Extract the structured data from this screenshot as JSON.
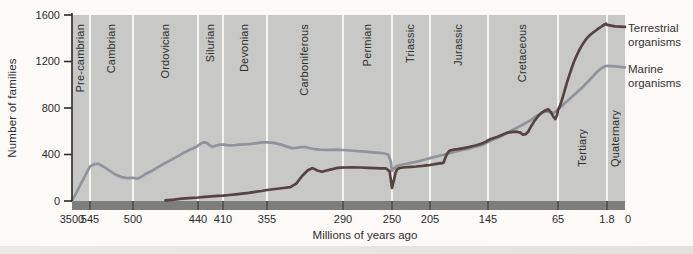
{
  "colors": {
    "plot_bg": "#c8c8c6",
    "gridline": "#f3f3f0",
    "axis_band": "#7e7e7c",
    "axis_band_tick": "#4f4f4d",
    "axis_line": "#2a2a2a",
    "terrestrial": "#544341",
    "marine": "#8f939b",
    "text": "#2e2e2e"
  },
  "figure": {
    "periods": [
      {
        "name": "Pre-cambrian",
        "from": 3500,
        "to": 545,
        "label_valign": "top"
      },
      {
        "name": "Cambrian",
        "from": 545,
        "to": 500,
        "label_valign": "top"
      },
      {
        "name": "Ordovician",
        "from": 500,
        "to": 440,
        "label_valign": "top"
      },
      {
        "name": "Silurian",
        "from": 440,
        "to": 410,
        "label_valign": "top"
      },
      {
        "name": "Devonian",
        "from": 410,
        "to": 355,
        "label_valign": "top"
      },
      {
        "name": "Carboniferous",
        "from": 355,
        "to": 290,
        "label_valign": "top"
      },
      {
        "name": "Permian",
        "from": 290,
        "to": 250,
        "label_valign": "top"
      },
      {
        "name": "Triassic",
        "from": 250,
        "to": 205,
        "label_valign": "top"
      },
      {
        "name": "Jurassic",
        "from": 205,
        "to": 145,
        "label_valign": "top"
      },
      {
        "name": "Cretaceous",
        "from": 145,
        "to": 65,
        "label_valign": "top"
      },
      {
        "name": "Tertiary",
        "from": 65,
        "to": 1.8,
        "label_valign": "bottom"
      },
      {
        "name": "Quaternary",
        "from": 1.8,
        "to": 0,
        "label_valign": "bottom"
      }
    ]
  },
  "chart_data": {
    "type": "line",
    "title": "",
    "xlabel": "Millions of years ago",
    "ylabel": "Number of families",
    "ylim": [
      0,
      1600
    ],
    "y_ticks": [
      0,
      400,
      800,
      1200,
      1600
    ],
    "x_direction": "reversed (3500 Ma at left, 0 at right)",
    "grid": "white vertical lines at geologic period boundaries",
    "legend_position": "right, outside plot",
    "x_ticks": [
      {
        "label": "3500",
        "ma": 3500
      },
      {
        "label": "545",
        "ma": 545
      },
      {
        "label": "500",
        "ma": 500
      },
      {
        "label": "440",
        "ma": 440
      },
      {
        "label": "410",
        "ma": 410
      },
      {
        "label": "355",
        "ma": 355
      },
      {
        "label": "290",
        "ma": 290
      },
      {
        "label": "250",
        "ma": 250
      },
      {
        "label": "205",
        "ma": 205
      },
      {
        "label": "145",
        "ma": 145
      },
      {
        "label": "65",
        "ma": 65
      },
      {
        "label": "1.8",
        "ma": 1.8
      },
      {
        "label": "0",
        "ma": 0
      }
    ],
    "x_axis_px": [
      [
        3500,
        72
      ],
      [
        545,
        90
      ],
      [
        500,
        133
      ],
      [
        440,
        198
      ],
      [
        410,
        223
      ],
      [
        355,
        267
      ],
      [
        290,
        343
      ],
      [
        250,
        392
      ],
      [
        205,
        430
      ],
      [
        145,
        488
      ],
      [
        65,
        558
      ],
      [
        1.8,
        607
      ],
      [
        0,
        625
      ]
    ],
    "plot_px": {
      "left": 72,
      "right": 625,
      "top": 15,
      "baseline": 201,
      "band_height": 9
    },
    "series": [
      {
        "name": "Terrestrial organisms",
        "color": "#544341",
        "points": [
          [
            470,
            5
          ],
          [
            462,
            12
          ],
          [
            455,
            20
          ],
          [
            448,
            25
          ],
          [
            440,
            30
          ],
          [
            432,
            36
          ],
          [
            424,
            40
          ],
          [
            416,
            44
          ],
          [
            410,
            46
          ],
          [
            402,
            52
          ],
          [
            394,
            58
          ],
          [
            386,
            64
          ],
          [
            378,
            70
          ],
          [
            370,
            78
          ],
          [
            362,
            86
          ],
          [
            355,
            95
          ],
          [
            348,
            103
          ],
          [
            341,
            112
          ],
          [
            335,
            120
          ],
          [
            330,
            150
          ],
          [
            325,
            215
          ],
          [
            320,
            265
          ],
          [
            316,
            283
          ],
          [
            312,
            262
          ],
          [
            308,
            252
          ],
          [
            304,
            262
          ],
          [
            300,
            272
          ],
          [
            296,
            282
          ],
          [
            292,
            287
          ],
          [
            288,
            288
          ],
          [
            282,
            290
          ],
          [
            276,
            288
          ],
          [
            270,
            285
          ],
          [
            264,
            282
          ],
          [
            259,
            280
          ],
          [
            255,
            281
          ],
          [
            252,
            255
          ],
          [
            250,
            112
          ],
          [
            248,
            170
          ],
          [
            246,
            240
          ],
          [
            244,
            272
          ],
          [
            241,
            284
          ],
          [
            237,
            288
          ],
          [
            232,
            291
          ],
          [
            227,
            294
          ],
          [
            221,
            297
          ],
          [
            215,
            301
          ],
          [
            209,
            306
          ],
          [
            205,
            310
          ],
          [
            200,
            317
          ],
          [
            195,
            324
          ],
          [
            191,
            329
          ],
          [
            188,
            395
          ],
          [
            185,
            432
          ],
          [
            181,
            441
          ],
          [
            176,
            446
          ],
          [
            170,
            455
          ],
          [
            164,
            465
          ],
          [
            158,
            477
          ],
          [
            152,
            492
          ],
          [
            147,
            510
          ],
          [
            145,
            522
          ],
          [
            140,
            538
          ],
          [
            134,
            552
          ],
          [
            128,
            572
          ],
          [
            122,
            588
          ],
          [
            117,
            594
          ],
          [
            112,
            596
          ],
          [
            108,
            588
          ],
          [
            105,
            570
          ],
          [
            102,
            575
          ],
          [
            99,
            598
          ],
          [
            96,
            640
          ],
          [
            92,
            688
          ],
          [
            88,
            728
          ],
          [
            84,
            758
          ],
          [
            80,
            778
          ],
          [
            76,
            788
          ],
          [
            73,
            762
          ],
          [
            70,
            722
          ],
          [
            68,
            705
          ],
          [
            66,
            740
          ],
          [
            65,
            782
          ],
          [
            62,
            825
          ],
          [
            59,
            890
          ],
          [
            56,
            960
          ],
          [
            53,
            1030
          ],
          [
            50,
            1090
          ],
          [
            47,
            1150
          ],
          [
            44,
            1205
          ],
          [
            41,
            1250
          ],
          [
            38,
            1292
          ],
          [
            35,
            1330
          ],
          [
            32,
            1362
          ],
          [
            29,
            1390
          ],
          [
            26,
            1412
          ],
          [
            23,
            1432
          ],
          [
            20,
            1448
          ],
          [
            17,
            1462
          ],
          [
            14,
            1478
          ],
          [
            11,
            1492
          ],
          [
            8,
            1505
          ],
          [
            5,
            1518
          ],
          [
            3,
            1526
          ],
          [
            1.8,
            1515
          ],
          [
            1,
            1502
          ],
          [
            0,
            1498
          ]
        ]
      },
      {
        "name": "Marine organisms",
        "color": "#8f939b",
        "points": [
          [
            3500,
            0
          ],
          [
            545,
            298
          ],
          [
            540,
            318
          ],
          [
            536,
            320
          ],
          [
            530,
            292
          ],
          [
            524,
            258
          ],
          [
            518,
            225
          ],
          [
            512,
            206
          ],
          [
            506,
            196
          ],
          [
            500,
            200
          ],
          [
            496,
            192
          ],
          [
            492,
            210
          ],
          [
            488,
            235
          ],
          [
            482,
            262
          ],
          [
            476,
            295
          ],
          [
            470,
            328
          ],
          [
            464,
            358
          ],
          [
            458,
            388
          ],
          [
            452,
            420
          ],
          [
            446,
            448
          ],
          [
            441,
            470
          ],
          [
            437,
            492
          ],
          [
            434,
            504
          ],
          [
            430,
            502
          ],
          [
            426,
            478
          ],
          [
            423,
            466
          ],
          [
            420,
            472
          ],
          [
            417,
            480
          ],
          [
            413,
            484
          ],
          [
            410,
            485
          ],
          [
            405,
            480
          ],
          [
            400,
            478
          ],
          [
            395,
            481
          ],
          [
            390,
            484
          ],
          [
            384,
            487
          ],
          [
            378,
            489
          ],
          [
            372,
            494
          ],
          [
            366,
            500
          ],
          [
            360,
            504
          ],
          [
            354,
            505
          ],
          [
            348,
            498
          ],
          [
            343,
            485
          ],
          [
            338,
            468
          ],
          [
            334,
            455
          ],
          [
            330,
            458
          ],
          [
            326,
            464
          ],
          [
            322,
            463
          ],
          [
            318,
            453
          ],
          [
            314,
            446
          ],
          [
            310,
            442
          ],
          [
            305,
            440
          ],
          [
            300,
            440
          ],
          [
            295,
            441
          ],
          [
            290,
            439
          ],
          [
            284,
            434
          ],
          [
            278,
            428
          ],
          [
            272,
            424
          ],
          [
            266,
            419
          ],
          [
            260,
            414
          ],
          [
            256,
            409
          ],
          [
            253,
            398
          ],
          [
            251,
            340
          ],
          [
            250,
            258
          ],
          [
            249,
            272
          ],
          [
            247,
            285
          ],
          [
            245,
            296
          ],
          [
            242,
            305
          ],
          [
            238,
            312
          ],
          [
            234,
            318
          ],
          [
            229,
            325
          ],
          [
            224,
            333
          ],
          [
            219,
            341
          ],
          [
            214,
            351
          ],
          [
            209,
            361
          ],
          [
            205,
            369
          ],
          [
            200,
            379
          ],
          [
            195,
            390
          ],
          [
            190,
            400
          ],
          [
            185,
            411
          ],
          [
            180,
            422
          ],
          [
            175,
            432
          ],
          [
            170,
            441
          ],
          [
            165,
            451
          ],
          [
            160,
            462
          ],
          [
            155,
            473
          ],
          [
            150,
            484
          ],
          [
            145,
            508
          ],
          [
            141,
            522
          ],
          [
            137,
            535
          ],
          [
            133,
            548
          ],
          [
            129,
            562
          ],
          [
            125,
            578
          ],
          [
            121,
            595
          ],
          [
            117,
            612
          ],
          [
            113,
            626
          ],
          [
            109,
            642
          ],
          [
            105,
            658
          ],
          [
            101,
            674
          ],
          [
            97,
            692
          ],
          [
            93,
            712
          ],
          [
            89,
            734
          ],
          [
            85,
            750
          ],
          [
            82,
            762
          ],
          [
            79,
            770
          ],
          [
            76,
            768
          ],
          [
            73,
            758
          ],
          [
            70,
            760
          ],
          [
            67,
            772
          ],
          [
            65,
            788
          ],
          [
            62,
            806
          ],
          [
            59,
            824
          ],
          [
            56,
            842
          ],
          [
            53,
            860
          ],
          [
            50,
            878
          ],
          [
            47,
            896
          ],
          [
            44,
            914
          ],
          [
            41,
            932
          ],
          [
            38,
            950
          ],
          [
            35,
            968
          ],
          [
            32,
            988
          ],
          [
            29,
            1008
          ],
          [
            26,
            1028
          ],
          [
            23,
            1050
          ],
          [
            20,
            1072
          ],
          [
            17,
            1094
          ],
          [
            14,
            1114
          ],
          [
            11,
            1132
          ],
          [
            8,
            1146
          ],
          [
            5,
            1156
          ],
          [
            3,
            1161
          ],
          [
            1.8,
            1162
          ],
          [
            1,
            1158
          ],
          [
            0,
            1150
          ]
        ]
      }
    ]
  }
}
